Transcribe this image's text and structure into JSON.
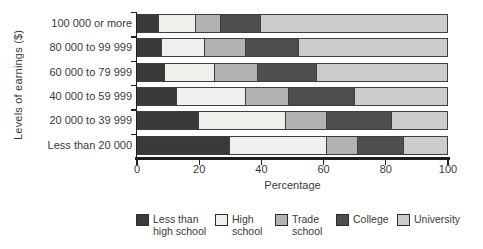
{
  "figure": {
    "background": "#ffffff",
    "text_color": "#3a3a3a",
    "axis_color": "#1f1f1f"
  },
  "chart_data": {
    "type": "bar",
    "variant": "horizontal-stacked",
    "xlabel": "Percentage",
    "ylabel": "Levels of earnings ($)",
    "xlim": [
      0,
      100
    ],
    "xticks": [
      0,
      20,
      40,
      60,
      80,
      100
    ],
    "grid": false,
    "legend_position": "bottom",
    "categories": [
      "100 000 or more",
      "80 000 to 99 999",
      "60 000 to 79 999",
      "40 000 to 59 999",
      "20 000 to 39 999",
      "Less than 20 000"
    ],
    "series": [
      {
        "name": "Less than high school",
        "color": "#3a3a3a",
        "values": [
          7,
          8,
          9,
          13,
          20,
          30
        ]
      },
      {
        "name": "High school",
        "color": "#f0efec",
        "values": [
          12,
          14,
          16,
          22,
          28,
          31
        ]
      },
      {
        "name": "Trade school",
        "color": "#b2b2b0",
        "values": [
          8,
          13,
          14,
          14,
          13,
          10
        ]
      },
      {
        "name": "College",
        "color": "#4e4e4e",
        "values": [
          13,
          17,
          19,
          21,
          21,
          15
        ]
      },
      {
        "name": "University",
        "color": "#cccccb",
        "values": [
          60,
          48,
          42,
          30,
          18,
          14
        ]
      }
    ]
  },
  "legend": {
    "items": [
      {
        "label": "Less than\nhigh school",
        "color": "#3a3a3a"
      },
      {
        "label": "High\nschool",
        "color": "#f0efec"
      },
      {
        "label": "Trade\nschool",
        "color": "#b2b2b0"
      },
      {
        "label": "College",
        "color": "#4e4e4e"
      },
      {
        "label": "University",
        "color": "#cccccb"
      }
    ]
  }
}
